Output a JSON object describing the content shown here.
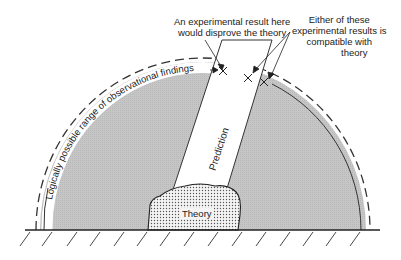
{
  "diagram": {
    "labels": {
      "disprove_line1": "An experimental result here",
      "disprove_line2": "would disprove the theory",
      "compatible_line1": "Either of these",
      "compatible_line2": "experimental results is",
      "compatible_line3": "compatible with",
      "compatible_line4": "theory",
      "arc_label": "Logically possible range of observational findings",
      "prediction": "Prediction",
      "theory": "Theory"
    },
    "colors": {
      "field": "#c8c8c8",
      "band": "#ffffff",
      "ink": "#2a2a2a"
    }
  }
}
